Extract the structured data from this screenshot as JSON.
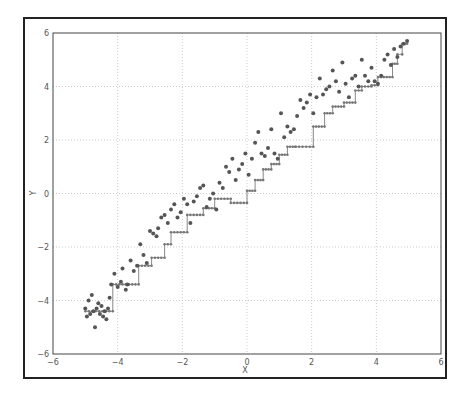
{
  "chart_data": {
    "type": "scatter",
    "title": "",
    "xlabel": "X",
    "ylabel": "Y",
    "xlim": [
      -6,
      6
    ],
    "ylim": [
      -6,
      6
    ],
    "xticks": [
      "-6",
      "-4",
      "-2",
      "0",
      "2",
      "4",
      "6"
    ],
    "yticks": [
      "6",
      "4",
      "2",
      "0",
      "-2",
      "-4",
      "-6"
    ],
    "grid": true,
    "legend": null,
    "colors": {
      "points": "#555555",
      "line": "#888888",
      "grid": "#cccccc",
      "axes": "#444444"
    },
    "series": [
      {
        "name": "observations",
        "kind": "scatter",
        "x": [
          -5.0,
          -4.95,
          -4.9,
          -4.85,
          -4.8,
          -4.75,
          -4.7,
          -4.65,
          -4.6,
          -4.55,
          -4.5,
          -4.45,
          -4.4,
          -4.35,
          -4.3,
          -4.25,
          -4.2,
          -4.1,
          -4.0,
          -3.9,
          -3.85,
          -3.75,
          -3.7,
          -3.6,
          -3.5,
          -3.4,
          -3.3,
          -3.2,
          -3.1,
          -3.0,
          -2.9,
          -2.8,
          -2.75,
          -2.65,
          -2.55,
          -2.45,
          -2.35,
          -2.25,
          -2.15,
          -2.05,
          -1.95,
          -1.85,
          -1.75,
          -1.65,
          -1.55,
          -1.45,
          -1.35,
          -1.25,
          -1.15,
          -1.05,
          -0.95,
          -0.85,
          -0.75,
          -0.65,
          -0.55,
          -0.45,
          -0.35,
          -0.25,
          -0.15,
          -0.05,
          0.05,
          0.15,
          0.25,
          0.35,
          0.45,
          0.55,
          0.65,
          0.75,
          0.85,
          0.95,
          1.05,
          1.15,
          1.25,
          1.35,
          1.45,
          1.55,
          1.65,
          1.75,
          1.85,
          1.95,
          2.05,
          2.15,
          2.25,
          2.35,
          2.45,
          2.55,
          2.65,
          2.75,
          2.85,
          2.95,
          3.05,
          3.15,
          3.25,
          3.35,
          3.45,
          3.55,
          3.65,
          3.75,
          3.85,
          3.95,
          4.05,
          4.15,
          4.25,
          4.35,
          4.45,
          4.55,
          4.65,
          4.75,
          4.85,
          4.95
        ],
        "y": [
          -4.3,
          -4.6,
          -4.0,
          -4.5,
          -3.8,
          -4.4,
          -5.0,
          -4.3,
          -4.1,
          -4.5,
          -4.2,
          -4.6,
          -4.4,
          -4.7,
          -4.3,
          -3.9,
          -3.4,
          -3.0,
          -3.5,
          -3.3,
          -2.8,
          -3.6,
          -3.4,
          -2.5,
          -2.9,
          -2.7,
          -1.9,
          -2.3,
          -2.6,
          -1.4,
          -1.5,
          -1.6,
          -1.3,
          -0.9,
          -0.8,
          -1.1,
          -0.6,
          -0.4,
          -0.9,
          -0.7,
          -0.2,
          -0.4,
          -1.1,
          -0.3,
          -0.1,
          0.2,
          0.3,
          -0.5,
          -0.2,
          0.0,
          -0.6,
          0.4,
          0.2,
          1.0,
          0.8,
          1.3,
          0.5,
          0.9,
          1.1,
          1.5,
          0.7,
          1.3,
          1.9,
          2.3,
          1.5,
          1.4,
          1.7,
          2.4,
          1.5,
          1.3,
          3.0,
          2.1,
          2.5,
          2.3,
          2.4,
          2.9,
          3.5,
          3.2,
          3.4,
          3.7,
          3.0,
          3.6,
          4.3,
          3.7,
          3.9,
          4.0,
          4.6,
          4.2,
          3.8,
          4.9,
          4.1,
          3.6,
          4.3,
          4.4,
          4.0,
          5.0,
          4.4,
          4.2,
          4.7,
          4.2,
          4.1,
          4.4,
          5.0,
          5.2,
          4.8,
          5.4,
          5.1,
          5.5,
          5.6,
          5.7
        ]
      },
      {
        "name": "step-fit",
        "kind": "step-line",
        "x": [
          -5.0,
          -4.15,
          -4.15,
          -3.35,
          -3.35,
          -2.95,
          -2.95,
          -2.55,
          -2.55,
          -2.35,
          -2.35,
          -1.85,
          -1.85,
          -1.35,
          -1.35,
          -1.0,
          -1.0,
          -0.5,
          -0.5,
          0.0,
          0.0,
          0.25,
          0.25,
          0.5,
          0.5,
          0.75,
          0.75,
          1.0,
          1.0,
          1.25,
          1.25,
          1.5,
          1.5,
          2.05,
          2.05,
          2.4,
          2.4,
          2.65,
          2.65,
          3.0,
          3.0,
          3.35,
          3.35,
          3.55,
          3.55,
          3.85,
          3.85,
          4.05,
          4.05,
          4.5,
          4.5,
          4.65,
          4.65,
          4.8,
          4.8,
          4.95
        ],
        "y": [
          -4.4,
          -4.4,
          -3.4,
          -3.4,
          -2.7,
          -2.7,
          -2.4,
          -2.4,
          -1.9,
          -1.9,
          -1.45,
          -1.45,
          -0.8,
          -0.8,
          -0.55,
          -0.55,
          -0.2,
          -0.2,
          -0.35,
          -0.35,
          0.1,
          0.1,
          0.5,
          0.5,
          0.9,
          0.9,
          1.1,
          1.1,
          1.45,
          1.45,
          1.75,
          1.75,
          1.75,
          1.75,
          2.5,
          2.5,
          3.0,
          3.0,
          3.25,
          3.25,
          3.4,
          3.4,
          3.85,
          3.85,
          4.0,
          4.0,
          4.05,
          4.05,
          4.35,
          4.35,
          4.85,
          4.85,
          5.2,
          5.2,
          5.6,
          5.6
        ]
      }
    ]
  }
}
